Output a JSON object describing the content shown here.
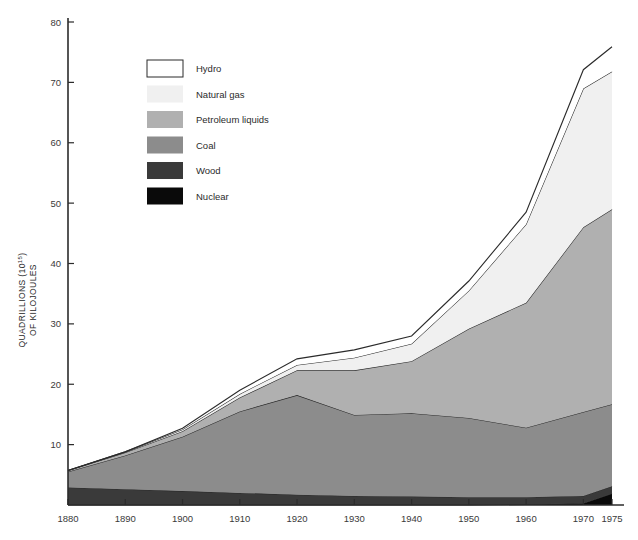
{
  "chart_data": {
    "type": "area",
    "title": "",
    "subtitle": "",
    "xlabel": "",
    "ylabel": "QUADRILLIONS (10¹⁵) OF KILOJOULES",
    "ylabel_line1": "QUADRILLIONS (10",
    "ylabel_exp": "15",
    "ylabel_line1_end": ")",
    "ylabel_line2": "OF KILOJOULES",
    "stacked": true,
    "grid": false,
    "legend_position": "upper-left-inside",
    "x": [
      1880,
      1890,
      1900,
      1910,
      1920,
      1930,
      1940,
      1950,
      1960,
      1970,
      1975
    ],
    "xticks": [
      "1880",
      "1890",
      "1900",
      "1910",
      "1920",
      "1930",
      "1940",
      "1950",
      "1960",
      "1970",
      "1975"
    ],
    "yticks": [
      "10",
      "20",
      "30",
      "40",
      "50",
      "60",
      "70",
      "80"
    ],
    "ytick_values": [
      10,
      20,
      30,
      40,
      50,
      60,
      70,
      80
    ],
    "xlim": [
      1880,
      1975
    ],
    "ylim": [
      0,
      80
    ],
    "series": [
      {
        "name": "Nuclear",
        "color": "#0a0a0a",
        "values": [
          0,
          0,
          0,
          0,
          0,
          0,
          0,
          0,
          0.1,
          0.3,
          1.9
        ]
      },
      {
        "name": "Wood",
        "color": "#3a3a3a",
        "values": [
          2.9,
          2.6,
          2.3,
          2.0,
          1.7,
          1.5,
          1.4,
          1.3,
          1.2,
          1.2,
          1.2
        ]
      },
      {
        "name": "Coal",
        "color": "#8c8c8c",
        "values": [
          2.6,
          5.6,
          9.0,
          13.5,
          16.5,
          13.4,
          13.8,
          13.1,
          11.5,
          13.9,
          13.6
        ]
      },
      {
        "name": "Petroleum liquids",
        "color": "#b0b0b0",
        "values": [
          0.2,
          0.5,
          0.9,
          2.3,
          4.1,
          7.4,
          8.6,
          14.8,
          20.7,
          30.6,
          32.3
        ]
      },
      {
        "name": "Natural gas",
        "color": "#f0f0f0",
        "values": [
          0.0,
          0.1,
          0.3,
          0.6,
          0.9,
          2.1,
          2.9,
          6.3,
          13.0,
          23.0,
          22.8
        ]
      },
      {
        "name": "Hydro",
        "color": "#ffffff",
        "values": [
          0.0,
          0.0,
          0.2,
          0.6,
          1.0,
          1.3,
          1.3,
          1.6,
          2.0,
          3.1,
          4.1
        ]
      }
    ],
    "legend": [
      {
        "label": "Hydro",
        "color": "#ffffff",
        "bordered": true
      },
      {
        "label": "Natural gas",
        "color": "#f0f0f0",
        "bordered": false
      },
      {
        "label": "Petroleum liquids",
        "color": "#b0b0b0",
        "bordered": false
      },
      {
        "label": "Coal",
        "color": "#8c8c8c",
        "bordered": false
      },
      {
        "label": "Wood",
        "color": "#3a3a3a",
        "bordered": false
      },
      {
        "label": "Nuclear",
        "color": "#0a0a0a",
        "bordered": false
      }
    ]
  }
}
